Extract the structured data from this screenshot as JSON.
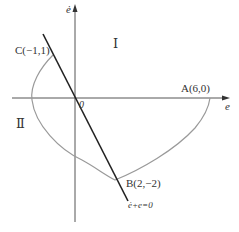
{
  "diagram": {
    "axes": {
      "x_label": "e",
      "y_label": "ė",
      "origin_label": "0"
    },
    "regions": {
      "region_1": "Ⅰ",
      "region_2": "Ⅱ"
    },
    "points": {
      "A": "A(6,0)",
      "B": "B(2,−2)",
      "C": "C(−1,1)"
    },
    "line_label": "ė+e=0",
    "colors": {
      "axis": "#555555",
      "curve": "#9a9a9a",
      "line": "#222222"
    }
  }
}
